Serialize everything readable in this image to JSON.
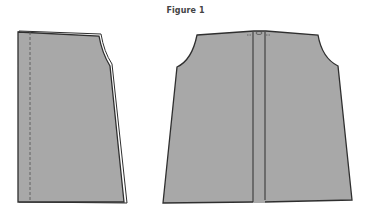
{
  "figure": {
    "title": "Figure 1"
  },
  "colors": {
    "fabric_fill": "#a8a8a8",
    "outline": "#2f2f2f",
    "background": "#ffffff",
    "title_text": "#444444"
  },
  "pieces": [
    {
      "name": "left-pattern-piece",
      "description": "side/front panel with dashed fold/seam line near left edge"
    },
    {
      "name": "right-pattern-piece",
      "description": "back panel with center placket strip"
    }
  ]
}
